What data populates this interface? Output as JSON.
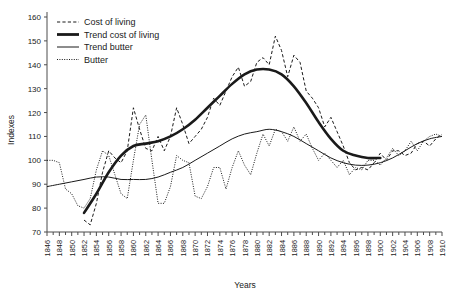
{
  "chart_data": {
    "type": "line",
    "title": "",
    "xlabel": "Years",
    "ylabel": "Indexes",
    "xlim": [
      1846,
      1910
    ],
    "ylim": [
      70,
      160
    ],
    "ytick_step": 10,
    "xtick_step": 2,
    "grid": false,
    "legend_position": "top-left",
    "yticks": [
      70,
      80,
      90,
      100,
      110,
      120,
      130,
      140,
      150,
      160
    ],
    "xticks": [
      1846,
      1848,
      1850,
      1852,
      1854,
      1856,
      1858,
      1860,
      1862,
      1864,
      1866,
      1868,
      1870,
      1872,
      1874,
      1876,
      1878,
      1880,
      1882,
      1884,
      1886,
      1888,
      1890,
      1892,
      1894,
      1896,
      1898,
      1900,
      1902,
      1904,
      1906,
      1908,
      1910
    ],
    "series": [
      {
        "name": "Cost of living",
        "style": "dashed",
        "x": [
          1852,
          1853,
          1854,
          1855,
          1856,
          1857,
          1858,
          1859,
          1860,
          1861,
          1862,
          1863,
          1864,
          1865,
          1866,
          1867,
          1868,
          1869,
          1870,
          1871,
          1872,
          1873,
          1874,
          1875,
          1876,
          1877,
          1878,
          1879,
          1880,
          1881,
          1882,
          1883,
          1884,
          1885,
          1886,
          1887,
          1888,
          1889,
          1890,
          1891,
          1892,
          1893,
          1894,
          1895,
          1896,
          1897,
          1898,
          1899,
          1900,
          1901,
          1902,
          1903,
          1904,
          1905,
          1906,
          1907,
          1908,
          1909,
          1910
        ],
        "values": [
          75,
          73,
          82,
          95,
          104,
          101,
          99,
          104,
          122,
          113,
          105,
          104,
          110,
          104,
          110,
          122,
          115,
          107,
          110,
          113,
          118,
          126,
          123,
          129,
          135,
          139,
          131,
          133,
          141,
          143,
          140,
          152,
          146,
          135,
          144,
          141,
          129,
          126,
          122,
          114,
          118,
          112,
          106,
          99,
          96,
          97,
          96,
          99,
          103,
          100,
          104,
          104,
          102,
          103,
          107,
          108,
          106,
          109,
          111
        ]
      },
      {
        "name": "Trend cost of living",
        "style": "thick-solid",
        "x": [
          1852,
          1854,
          1856,
          1858,
          1860,
          1862,
          1864,
          1866,
          1868,
          1870,
          1872,
          1874,
          1876,
          1878,
          1880,
          1882,
          1884,
          1886,
          1888,
          1890,
          1892,
          1894,
          1896,
          1898,
          1900
        ],
        "values": [
          78,
          86,
          95,
          102,
          106,
          107,
          108,
          110,
          113,
          117,
          122,
          127,
          132,
          136,
          138,
          138,
          136,
          131,
          124,
          116,
          109,
          104,
          102,
          101,
          101
        ]
      },
      {
        "name": "Trend butter",
        "style": "thin-solid",
        "x": [
          1846,
          1848,
          1850,
          1852,
          1854,
          1856,
          1858,
          1860,
          1862,
          1864,
          1866,
          1868,
          1870,
          1872,
          1874,
          1876,
          1878,
          1880,
          1882,
          1884,
          1886,
          1888,
          1890,
          1892,
          1894,
          1896,
          1898,
          1900,
          1902,
          1904,
          1906,
          1908,
          1910
        ],
        "values": [
          89,
          90,
          91,
          92,
          93,
          93,
          92,
          92,
          92,
          93,
          95,
          97,
          100,
          103,
          106,
          109,
          111,
          112,
          113,
          112,
          110,
          107,
          104,
          101,
          99,
          98,
          98,
          99,
          101,
          104,
          107,
          109,
          110
        ]
      },
      {
        "name": "Butter",
        "style": "dotted",
        "x": [
          1846,
          1847,
          1848,
          1849,
          1850,
          1851,
          1852,
          1853,
          1854,
          1855,
          1856,
          1857,
          1858,
          1859,
          1860,
          1861,
          1862,
          1863,
          1864,
          1865,
          1866,
          1867,
          1868,
          1869,
          1870,
          1871,
          1872,
          1873,
          1874,
          1875,
          1876,
          1877,
          1878,
          1879,
          1880,
          1881,
          1882,
          1883,
          1884,
          1885,
          1886,
          1887,
          1888,
          1889,
          1890,
          1891,
          1892,
          1893,
          1894,
          1895,
          1896,
          1897,
          1898,
          1899,
          1900,
          1901,
          1902,
          1903,
          1904,
          1905,
          1906,
          1907,
          1908,
          1909,
          1910
        ],
        "values": [
          100,
          100,
          99,
          88,
          86,
          81,
          80,
          84,
          96,
          104,
          102,
          94,
          86,
          84,
          100,
          115,
          119,
          100,
          82,
          82,
          89,
          102,
          100,
          99,
          85,
          84,
          89,
          97,
          97,
          88,
          97,
          104,
          98,
          94,
          103,
          111,
          106,
          113,
          112,
          108,
          114,
          108,
          111,
          105,
          100,
          103,
          100,
          97,
          100,
          94,
          97,
          96,
          100,
          100,
          98,
          101,
          105,
          102,
          104,
          108,
          104,
          108,
          110,
          111,
          110
        ]
      }
    ]
  },
  "legend": {
    "items": [
      {
        "label": "Cost of living",
        "style": "dashed"
      },
      {
        "label": "Trend cost of living",
        "style": "thick-solid"
      },
      {
        "label": "Trend butter",
        "style": "thin-solid"
      },
      {
        "label": "Butter",
        "style": "dotted"
      }
    ]
  }
}
